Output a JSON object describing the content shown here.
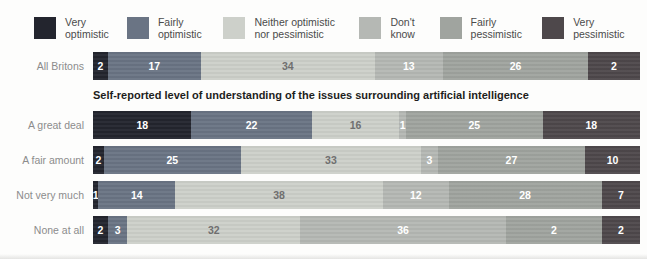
{
  "chart_data": {
    "type": "bar",
    "orientation": "horizontal",
    "stacked": true,
    "unit": "%",
    "legend_position": "top",
    "legend_items": [
      {
        "label": "Very optimistic",
        "color": "#23252e"
      },
      {
        "label": "Fairly optimistic",
        "color": "#6a7484"
      },
      {
        "label": "Neither optimistic nor pessimistic",
        "color": "#cdd0ca"
      },
      {
        "label": "Don't know",
        "color": "#b5b8b4"
      },
      {
        "label": "Fairly pessimistic",
        "color": "#a0a49f"
      },
      {
        "label": "Very pessimistic",
        "color": "#4e484b"
      }
    ],
    "group_heading": "Self-reported level of understanding of the issues surrounding artificial intelligence",
    "categories": [
      "All Britons",
      "A great deal",
      "A fair amount",
      "Not very much",
      "None at all"
    ],
    "rows": [
      {
        "label": "All Britons",
        "values": [
          2,
          17,
          34,
          13,
          26,
          2
        ]
      },
      {
        "label": "A great deal",
        "values": [
          18,
          22,
          16,
          1,
          25,
          18
        ]
      },
      {
        "label": "A fair amount",
        "values": [
          2,
          25,
          33,
          3,
          27,
          10
        ]
      },
      {
        "label": "Not very much",
        "values": [
          1,
          14,
          38,
          12,
          28,
          7
        ]
      },
      {
        "label": "None at all",
        "values": [
          2,
          3,
          32,
          36,
          2,
          2
        ]
      }
    ],
    "segment_widths_pct": [
      [
        2.7,
        17,
        31.8,
        12.5,
        26.5,
        9.5
      ],
      [
        18,
        22,
        16,
        1.2,
        25,
        17.8
      ],
      [
        2,
        25,
        33,
        3,
        27,
        10
      ],
      [
        1,
        14,
        38,
        12,
        28,
        7
      ],
      [
        2.7,
        3.6,
        31.6,
        37.6,
        17.5,
        7
      ]
    ]
  },
  "colors": {
    "value_text_on_dark": "#ffffff",
    "value_text_on_light": "#6f6f6f",
    "row_label_text": "#8c8c8c",
    "heading_text": "#1e1e1c",
    "legend_text": "#4b4b4b",
    "background": "#fdfdfc"
  }
}
